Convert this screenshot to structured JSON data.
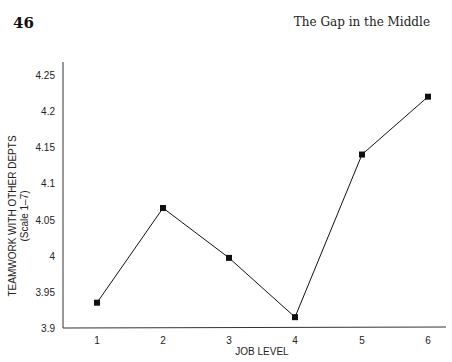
{
  "header": {
    "page_number": "46",
    "running_head": "The Gap in the Middle"
  },
  "chart_data": {
    "type": "line",
    "title": "",
    "xlabel": "JOB LEVEL",
    "ylabel": "TEAMWORK WITH OTHER DEPTS",
    "ylabel_sub": "(Scale 1–7)",
    "categories": [
      "1",
      "2",
      "3",
      "4",
      "5",
      "6"
    ],
    "x": [
      1,
      2,
      3,
      4,
      5,
      6
    ],
    "series": [
      {
        "name": "Teamwork with other depts",
        "values": [
          3.935,
          4.066,
          3.997,
          3.915,
          4.14,
          4.22
        ],
        "marker": "square",
        "color": "#111111"
      }
    ],
    "yticks": [
      "3.9",
      "3.95",
      "4",
      "4.05",
      "4.1",
      "4.15",
      "4.2",
      "4.25"
    ],
    "ylim": [
      3.9,
      4.25
    ],
    "grid": false,
    "legend": "none"
  }
}
